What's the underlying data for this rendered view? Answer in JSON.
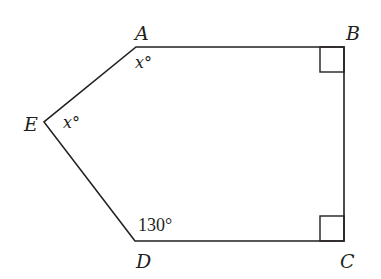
{
  "diagram": {
    "type": "pentagon",
    "colors": {
      "stroke": "#231f20",
      "background": "#ffffff"
    },
    "vertices": [
      {
        "name": "A",
        "x": 136,
        "y": 47
      },
      {
        "name": "B",
        "x": 344,
        "y": 47
      },
      {
        "name": "C",
        "x": 344,
        "y": 241
      },
      {
        "name": "D",
        "x": 135,
        "y": 241
      },
      {
        "name": "E",
        "x": 44,
        "y": 122
      }
    ],
    "labels": {
      "A": "A",
      "B": "B",
      "C": "C",
      "D": "D",
      "E": "E"
    },
    "angles": {
      "A": "x°",
      "E": "x°",
      "D": "130°",
      "B": "right-angle",
      "C": "right-angle"
    }
  }
}
